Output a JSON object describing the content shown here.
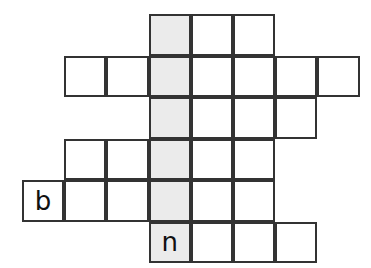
{
  "puzzle": {
    "type": "crossword-grid",
    "title": "",
    "geometry": {
      "image_width": 371,
      "image_height": 268,
      "cell_width": 42.2,
      "cell_height": 41.5,
      "origin_x": 22,
      "origin_y": 14,
      "columns": 8,
      "rows": 6
    },
    "colors": {
      "background": "#ffffff",
      "cell_fill": "#ffffff",
      "highlight_fill": "#ebebeb",
      "border": "#333333",
      "letter": "#111111"
    },
    "highlight_column_index": 3,
    "rows_data": [
      {
        "row_index": 0,
        "start_col": 3,
        "cells": [
          {
            "col": 3,
            "letter": "",
            "shaded": true
          },
          {
            "col": 4,
            "letter": "",
            "shaded": false
          },
          {
            "col": 5,
            "letter": "",
            "shaded": false
          }
        ]
      },
      {
        "row_index": 1,
        "start_col": 1,
        "cells": [
          {
            "col": 1,
            "letter": "",
            "shaded": false
          },
          {
            "col": 2,
            "letter": "",
            "shaded": false
          },
          {
            "col": 3,
            "letter": "",
            "shaded": true
          },
          {
            "col": 4,
            "letter": "",
            "shaded": false
          },
          {
            "col": 5,
            "letter": "",
            "shaded": false
          },
          {
            "col": 6,
            "letter": "",
            "shaded": false
          },
          {
            "col": 7,
            "letter": "",
            "shaded": false
          }
        ]
      },
      {
        "row_index": 2,
        "start_col": 3,
        "cells": [
          {
            "col": 3,
            "letter": "",
            "shaded": true
          },
          {
            "col": 4,
            "letter": "",
            "shaded": false
          },
          {
            "col": 5,
            "letter": "",
            "shaded": false
          },
          {
            "col": 6,
            "letter": "",
            "shaded": false
          }
        ]
      },
      {
        "row_index": 3,
        "start_col": 1,
        "cells": [
          {
            "col": 1,
            "letter": "",
            "shaded": false
          },
          {
            "col": 2,
            "letter": "",
            "shaded": false
          },
          {
            "col": 3,
            "letter": "",
            "shaded": true
          },
          {
            "col": 4,
            "letter": "",
            "shaded": false
          },
          {
            "col": 5,
            "letter": "",
            "shaded": false
          }
        ]
      },
      {
        "row_index": 4,
        "start_col": 0,
        "cells": [
          {
            "col": 0,
            "letter": "b",
            "shaded": false
          },
          {
            "col": 1,
            "letter": "",
            "shaded": false
          },
          {
            "col": 2,
            "letter": "",
            "shaded": false
          },
          {
            "col": 3,
            "letter": "",
            "shaded": true
          },
          {
            "col": 4,
            "letter": "",
            "shaded": false
          },
          {
            "col": 5,
            "letter": "",
            "shaded": false
          }
        ]
      },
      {
        "row_index": 5,
        "start_col": 3,
        "cells": [
          {
            "col": 3,
            "letter": "n",
            "shaded": true
          },
          {
            "col": 4,
            "letter": "",
            "shaded": false
          },
          {
            "col": 5,
            "letter": "",
            "shaded": false
          },
          {
            "col": 6,
            "letter": "",
            "shaded": false
          }
        ]
      }
    ],
    "filled_letters": [
      "b",
      "n"
    ]
  }
}
